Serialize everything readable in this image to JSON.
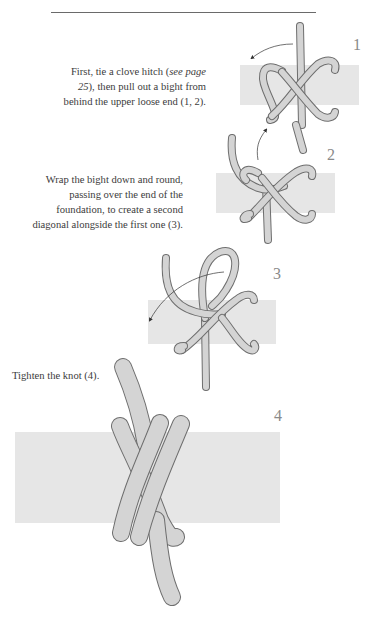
{
  "page": {
    "top_rule": true
  },
  "steps": [
    {
      "number": "1",
      "caption_parts": [
        "First, tie a clove hitch (",
        "see page 25",
        "), then pull out a bight from behind the upper loose end (1, 2)."
      ],
      "figure": "clove-hitch-with-bight"
    },
    {
      "number": "2",
      "caption": "Wrap the bight down and round, passing over the end of the foundation, to create a second diagonal alongside the first one (3).",
      "figure": "bight-wrapped"
    },
    {
      "number": "3",
      "caption": "",
      "figure": "second-diagonal"
    },
    {
      "number": "4",
      "caption": "Tighten the knot (4).",
      "figure": "tightened-knot"
    }
  ],
  "colors": {
    "foundation": "#e6e6e6",
    "rope_fill": "#d4d4d4",
    "rope_outline": "#6e6e6e",
    "step_number": "#8a8a8a",
    "text": "#3c3c3c"
  }
}
